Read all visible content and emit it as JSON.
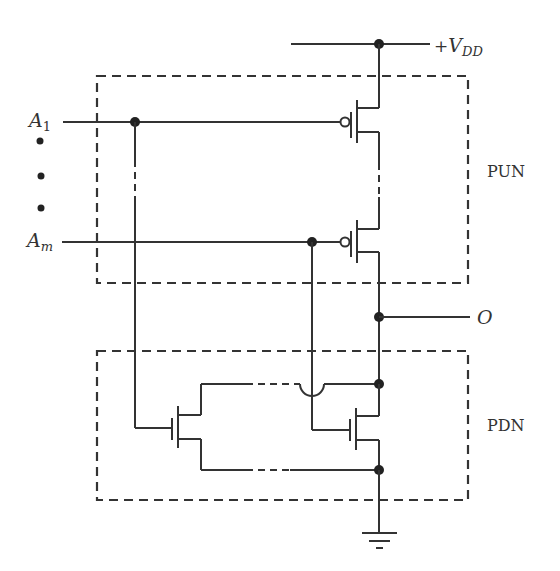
{
  "diagram": {
    "labels": {
      "vdd_prefix": "+",
      "vdd_main": "V",
      "vdd_sub": "DD",
      "input_first_main": "A",
      "input_first_sub": "1",
      "input_last_main": "A",
      "input_last_sub": "m",
      "output": "O",
      "pun": "PUN",
      "pdn": "PDN"
    },
    "blocks": [
      {
        "name": "PUN",
        "description": "Pull-up network of PMOS transistors in series between +VDD and O"
      },
      {
        "name": "PDN",
        "description": "Pull-down network of NMOS transistors in parallel between O and ground"
      }
    ],
    "components": [
      {
        "type": "pmos",
        "gate": "A1",
        "network": "PUN"
      },
      {
        "type": "pmos",
        "gate": "Am",
        "network": "PUN"
      },
      {
        "type": "nmos",
        "gate": "A1",
        "network": "PDN"
      },
      {
        "type": "nmos",
        "gate": "Am",
        "network": "PDN"
      },
      {
        "type": "ground"
      },
      {
        "type": "supply",
        "label": "+VDD"
      }
    ],
    "ellipsis_dots": 3,
    "colors": {
      "line": "#333333",
      "background": "#ffffff"
    }
  }
}
